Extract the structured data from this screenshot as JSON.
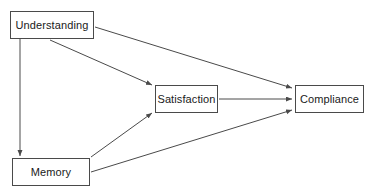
{
  "diagram": {
    "type": "directed-graph",
    "background_color": "#ffffff",
    "node_border_color": "#4a4a4a",
    "node_fill_color": "#ffffff",
    "edge_color": "#4a4a4a",
    "text_color": "#1a1a1a",
    "nodes": [
      {
        "id": "understanding",
        "label": "Understanding",
        "x": 10,
        "y": 11,
        "width": 84,
        "height": 28
      },
      {
        "id": "satisfaction",
        "label": "Satisfaction",
        "x": 155,
        "y": 85,
        "width": 63,
        "height": 28
      },
      {
        "id": "compliance",
        "label": "Compliance",
        "x": 295,
        "y": 85,
        "width": 69,
        "height": 28
      },
      {
        "id": "memory",
        "label": "Memory",
        "x": 12,
        "y": 158,
        "width": 78,
        "height": 28
      }
    ],
    "edges": [
      {
        "id": "understanding-to-memory",
        "from": "understanding",
        "to": "memory",
        "label": "",
        "directed": true,
        "path": "M 20 39 L 20 156"
      },
      {
        "id": "understanding-to-satisfaction",
        "from": "understanding",
        "to": "satisfaction",
        "label": "",
        "directed": true,
        "path": "M 50 40 L 152 85"
      },
      {
        "id": "understanding-to-compliance",
        "from": "understanding",
        "to": "compliance",
        "label": "",
        "directed": true,
        "path": "M 95 27 L 292 88"
      },
      {
        "id": "memory-to-satisfaction",
        "from": "memory",
        "to": "satisfaction",
        "label": "",
        "directed": true,
        "path": "M 91 157 L 152 113"
      },
      {
        "id": "memory-to-compliance",
        "from": "memory",
        "to": "compliance",
        "label": "",
        "directed": true,
        "path": "M 91 172 L 292 110"
      },
      {
        "id": "satisfaction-to-compliance",
        "from": "satisfaction",
        "to": "compliance",
        "label": "",
        "directed": true,
        "path": "M 219 99 L 292 99"
      }
    ]
  }
}
